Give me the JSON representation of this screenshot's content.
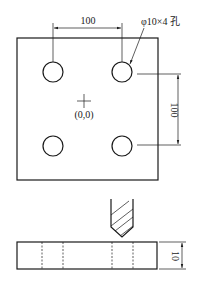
{
  "drawing": {
    "top_view": {
      "horizontal_dimension": "100",
      "vertical_dimension": "100",
      "hole_callout": "φ10×4 孔",
      "origin_label": "(0,0)"
    },
    "side_view": {
      "thickness_dimension": "10"
    }
  }
}
